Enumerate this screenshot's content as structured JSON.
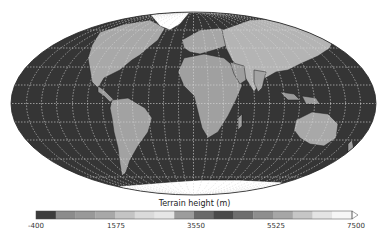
{
  "figure": {
    "projection": "Mollweide",
    "title": "",
    "colors": {
      "ocean": "#353535",
      "grid": "#d8d8d8",
      "land_low": "#9a9a9a",
      "land_high": "#c8c8c8",
      "ice": "#ffffff",
      "border": "#222222"
    }
  },
  "colorbar": {
    "label": "Terrain height (m)",
    "min": -400,
    "max": 7500,
    "extend": "max",
    "ticks": [
      {
        "value": "-400",
        "x": 36
      },
      {
        "value": "1575",
        "x": 116
      },
      {
        "value": "3550",
        "x": 196
      },
      {
        "value": "5525",
        "x": 276
      },
      {
        "value": "7500",
        "x": 356
      }
    ],
    "segments": [
      "#3c3c3c",
      "#8c8c8c",
      "#999999",
      "#a8a8a8",
      "#c4c4c4",
      "#dadada",
      "#e6e6e6",
      "#9c9c9c",
      "#6a6a6a",
      "#4a4a4a",
      "#6e6e6e",
      "#8e8e8e",
      "#a6a6a6",
      "#c6c6c6",
      "#e4e4e4",
      "#f6f6f6"
    ]
  }
}
